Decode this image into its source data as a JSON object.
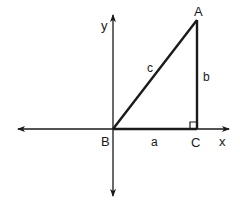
{
  "diagram": {
    "type": "right-triangle-on-coordinate-axes",
    "colors": {
      "ink": "#1a1a1a",
      "background": "#ffffff"
    },
    "axes": {
      "x_label": "x",
      "y_label": "y"
    },
    "vertices": {
      "A": "A",
      "B": "B",
      "C": "C"
    },
    "sides": {
      "a": "a",
      "b": "b",
      "c": "c"
    },
    "right_angle_at": "C"
  }
}
